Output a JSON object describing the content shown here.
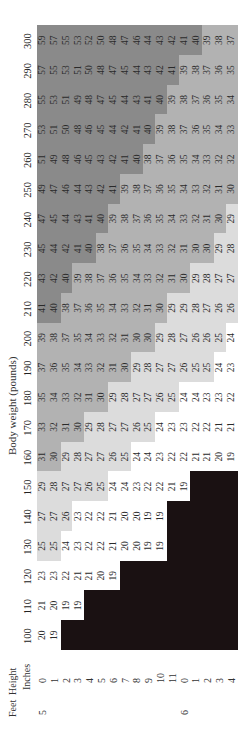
{
  "title": "Body weight (pounds)",
  "height_header": {
    "group": "Height",
    "feet_label": "Feet",
    "inches_label": "Inches"
  },
  "feet_markers": [
    {
      "label": "5",
      "row": 0
    },
    {
      "label": "6",
      "row": 12
    }
  ],
  "inches": [
    "0",
    "1",
    "2",
    "3",
    "4",
    "5",
    "6",
    "7",
    "8",
    "9",
    "10",
    "11",
    "0",
    "1",
    "2",
    "3",
    "4"
  ],
  "weights": [
    "100",
    "110",
    "120",
    "130",
    "140",
    "150",
    "160",
    "170",
    "180",
    "190",
    "200",
    "210",
    "220",
    "230",
    "240",
    "250",
    "260",
    "270",
    "280",
    "290",
    "300"
  ],
  "zones": {
    "underweight": {
      "color": "#1a1112",
      "range": "<19 (blank)"
    },
    "normal": {
      "color": "#ffffff",
      "range": "19-24"
    },
    "overweight": {
      "color": "#dcdcdc",
      "range": "25-29"
    },
    "obese": {
      "color": "#b2b2b2",
      "range": "30-39"
    },
    "extreme": {
      "color": "#8a8a8a",
      "range": ">=40"
    }
  },
  "bmi": {
    "100": [
      "20",
      "19",
      "",
      "",
      "",
      "",
      "",
      "",
      "",
      "",
      "",
      "",
      "",
      "",
      "",
      "",
      ""
    ],
    "110": [
      "21",
      "20",
      "19",
      "19",
      "",
      "",
      "",
      "",
      "",
      "",
      "",
      "",
      "",
      "",
      "",
      "",
      ""
    ],
    "120": [
      "23",
      "23",
      "22",
      "21",
      "21",
      "20",
      "19",
      "",
      "",
      "",
      "",
      "",
      "",
      "",
      "",
      "",
      ""
    ],
    "130": [
      "25",
      "25",
      "24",
      "23",
      "22",
      "22",
      "21",
      "20",
      "20",
      "19",
      "19",
      "",
      "",
      "",
      "",
      "",
      ""
    ],
    "140": [
      "27",
      "27",
      "26",
      "23",
      "22",
      "22",
      "21",
      "20",
      "20",
      "19",
      "19",
      "",
      "",
      "",
      "",
      "",
      ""
    ],
    "150": [
      "29",
      "28",
      "27",
      "27",
      "26",
      "25",
      "24",
      "24",
      "23",
      "22",
      "22",
      "21",
      "19",
      "",
      "",
      "",
      ""
    ],
    "160": [
      "31",
      "30",
      "29",
      "28",
      "27",
      "27",
      "26",
      "25",
      "24",
      "24",
      "23",
      "22",
      "22",
      "21",
      "21",
      "20",
      "19"
    ],
    "170": [
      "33",
      "32",
      "31",
      "30",
      "29",
      "28",
      "27",
      "27",
      "26",
      "25",
      "24",
      "23",
      "23",
      "22",
      "22",
      "21",
      "21"
    ],
    "180": [
      "35",
      "34",
      "33",
      "32",
      "31",
      "30",
      "29",
      "28",
      "27",
      "27",
      "26",
      "25",
      "24",
      "24",
      "23",
      "23",
      "22"
    ],
    "190": [
      "37",
      "36",
      "35",
      "34",
      "33",
      "32",
      "31",
      "30",
      "29",
      "28",
      "27",
      "27",
      "26",
      "25",
      "25",
      "24",
      "23"
    ],
    "200": [
      "39",
      "38",
      "37",
      "35",
      "34",
      "33",
      "32",
      "31",
      "30",
      "30",
      "29",
      "28",
      "27",
      "26",
      "26",
      "25",
      "24"
    ],
    "210": [
      "41",
      "40",
      "38",
      "37",
      "36",
      "35",
      "34",
      "33",
      "32",
      "31",
      "30",
      "29",
      "29",
      "28",
      "27",
      "26",
      "26"
    ],
    "220": [
      "43",
      "42",
      "40",
      "39",
      "38",
      "37",
      "36",
      "35",
      "34",
      "33",
      "32",
      "31",
      "30",
      "29",
      "28",
      "27",
      "27"
    ],
    "230": [
      "45",
      "44",
      "42",
      "41",
      "40",
      "38",
      "37",
      "36",
      "35",
      "34",
      "33",
      "32",
      "31",
      "30",
      "30",
      "29",
      "28"
    ],
    "240": [
      "47",
      "45",
      "44",
      "43",
      "41",
      "40",
      "39",
      "38",
      "37",
      "36",
      "35",
      "34",
      "33",
      "32",
      "31",
      "30",
      "29"
    ],
    "250": [
      "49",
      "47",
      "46",
      "44",
      "43",
      "42",
      "41",
      "39",
      "38",
      "37",
      "36",
      "35",
      "34",
      "33",
      "32",
      "31",
      "30"
    ],
    "260": [
      "51",
      "49",
      "48",
      "46",
      "45",
      "43",
      "42",
      "41",
      "40",
      "38",
      "37",
      "36",
      "35",
      "34",
      "33",
      "32",
      "32"
    ],
    "270": [
      "53",
      "51",
      "50",
      "48",
      "46",
      "45",
      "44",
      "42",
      "41",
      "40",
      "39",
      "38",
      "37",
      "36",
      "35",
      "34",
      "33"
    ],
    "280": [
      "55",
      "53",
      "51",
      "49",
      "48",
      "47",
      "45",
      "44",
      "43",
      "41",
      "40",
      "39",
      "38",
      "37",
      "36",
      "35",
      "34"
    ],
    "290": [
      "57",
      "55",
      "53",
      "51",
      "50",
      "48",
      "47",
      "45",
      "44",
      "43",
      "42",
      "41",
      "39",
      "38",
      "37",
      "36",
      "35"
    ],
    "300": [
      "59",
      "57",
      "55",
      "53",
      "52",
      "50",
      "48",
      "47",
      "46",
      "44",
      "43",
      "42",
      "41",
      "40",
      "39",
      "38",
      "37"
    ]
  }
}
